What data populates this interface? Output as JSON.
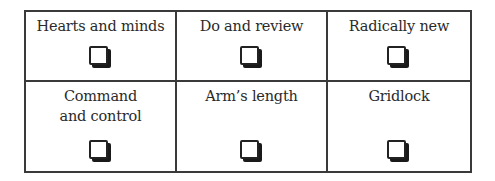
{
  "grid": {
    "rows": [
      {
        "cells": [
          {
            "label": "Hearts and minds",
            "checkbox": "empty-checkbox-icon",
            "checked": false
          },
          {
            "label": "Do and review",
            "checkbox": "empty-checkbox-icon",
            "checked": false
          },
          {
            "label": "Radically new",
            "checkbox": "empty-checkbox-icon",
            "checked": false
          }
        ]
      },
      {
        "cells": [
          {
            "label": "Command and control",
            "checkbox": "empty-checkbox-icon",
            "checked": false
          },
          {
            "label": "Arm’s length",
            "checkbox": "empty-checkbox-icon",
            "checked": false
          },
          {
            "label": "Gridlock",
            "checkbox": "empty-checkbox-icon",
            "checked": false
          }
        ]
      }
    ],
    "colors": {
      "border": "#3a3a3a",
      "text": "#2a2a2a",
      "background": "#ffffff"
    }
  }
}
